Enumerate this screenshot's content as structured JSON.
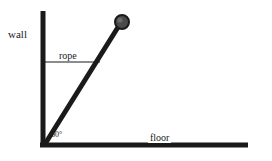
{
  "diagram": {
    "background_color": "#ffffff",
    "stroke_color": "#1a1a1a",
    "labels": {
      "wall": "wall",
      "rope": "rope",
      "floor": "floor",
      "angle": "60°"
    },
    "geometry": {
      "wall": {
        "x": 43,
        "y_top": 11,
        "y_bottom": 146,
        "thickness": 5
      },
      "floor": {
        "y": 145,
        "x_left": 40,
        "x_right": 248,
        "thickness": 5
      },
      "rod": {
        "x1": 45,
        "y1": 144,
        "x2": 120,
        "y2": 24,
        "thickness": 5
      },
      "rope": {
        "y": 62,
        "x_left": 43,
        "x_right": 100,
        "thickness": 1
      },
      "ball": {
        "cx": 122,
        "cy": 22,
        "r": 7
      }
    },
    "angle_value": 60,
    "angle_unit": "degrees"
  }
}
